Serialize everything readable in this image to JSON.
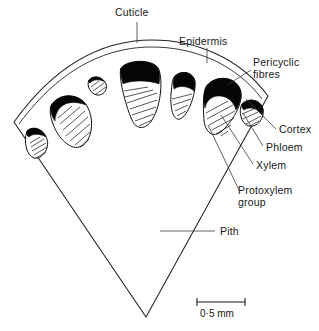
{
  "figure": {
    "type": "botanical-diagram"
  },
  "labels": {
    "cuticle": "Cuticle",
    "epidermis": "Epidermis",
    "pericyclic_fibres_line1": "Pericyclic",
    "pericyclic_fibres_line2": "fibres",
    "cortex": "Cortex",
    "phloem": "Phloem",
    "xylem": "Xylem",
    "protoxylem_line1": "Protoxylem",
    "protoxylem_line2": "group",
    "pith": "Pith"
  },
  "scale": {
    "value": "0·5 mm"
  },
  "colors": {
    "ink": "#171717",
    "fibre_black": "#050505",
    "background": "#ffffff"
  },
  "bundles": [
    {
      "name": "bundle-far-left",
      "size": "small"
    },
    {
      "name": "bundle-left",
      "size": "large"
    },
    {
      "name": "bundle-left-small",
      "size": "tiny"
    },
    {
      "name": "bundle-center",
      "size": "largest"
    },
    {
      "name": "bundle-right-inner",
      "size": "medium"
    },
    {
      "name": "bundle-right",
      "size": "large"
    },
    {
      "name": "bundle-far-right",
      "size": "small"
    }
  ]
}
